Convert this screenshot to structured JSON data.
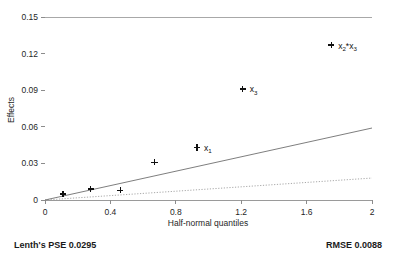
{
  "chart_data": {
    "type": "scatter",
    "title": "",
    "xlabel": "Half-normal quantiles",
    "ylabel": "Effects",
    "xlim": [
      0,
      2
    ],
    "ylim": [
      0,
      0.15
    ],
    "grid": false,
    "legend": "none",
    "xticks": [
      "0",
      "0.4",
      "0.8",
      "1.2",
      "1.6",
      "2"
    ],
    "xtick_values": [
      0,
      0.4,
      0.8,
      1.2,
      1.6,
      2
    ],
    "yticks": [
      "0",
      "0.03",
      "0.06",
      "0.09",
      "0.12",
      "0.15"
    ],
    "ytick_values": [
      0,
      0.03,
      0.06,
      0.09,
      0.12,
      0.15
    ],
    "points": [
      {
        "x": 0.11,
        "y": 0.005,
        "label": ""
      },
      {
        "x": 0.28,
        "y": 0.009,
        "label": ""
      },
      {
        "x": 0.46,
        "y": 0.008,
        "label": ""
      },
      {
        "x": 0.67,
        "y": 0.031,
        "label": ""
      },
      {
        "x": 0.93,
        "y": 0.043,
        "label": "x1"
      },
      {
        "x": 1.21,
        "y": 0.091,
        "label": "x3"
      },
      {
        "x": 1.75,
        "y": 0.127,
        "label": "x2*x3"
      }
    ],
    "point_labels": [
      {
        "base": "x",
        "sub": "1",
        "x": 0.93,
        "y": 0.043
      },
      {
        "base": "x",
        "sub": "3",
        "x": 1.21,
        "y": 0.091
      },
      {
        "base": "x",
        "sub": "2",
        "sub2": "3",
        "x": 1.75,
        "y": 0.127
      }
    ],
    "reference_line": {
      "style": "solid",
      "from": [
        0,
        0
      ],
      "to": [
        2,
        0.059
      ]
    },
    "pse_line": {
      "style": "dotted",
      "from": [
        0,
        0
      ],
      "to": [
        2,
        0.018
      ]
    },
    "annotations": {
      "lenths_pse": "Lenth's PSE 0.0295",
      "rmse": "RMSE 0.0088"
    },
    "lenths_pse_value": 0.0295,
    "rmse_value": 0.0088,
    "colors": {
      "background": "#ffffff",
      "axis": "#9a9a9a",
      "marker": "#101010",
      "reference_line": "#6f6f6f",
      "pse_line": "#9e9e9e",
      "text": "#1a1a1a"
    }
  },
  "footer": {
    "left": "Lenth's PSE 0.0295",
    "right": "RMSE 0.0088"
  },
  "axes": {
    "x_title": "Half-normal quantiles",
    "y_title": "Effects"
  }
}
